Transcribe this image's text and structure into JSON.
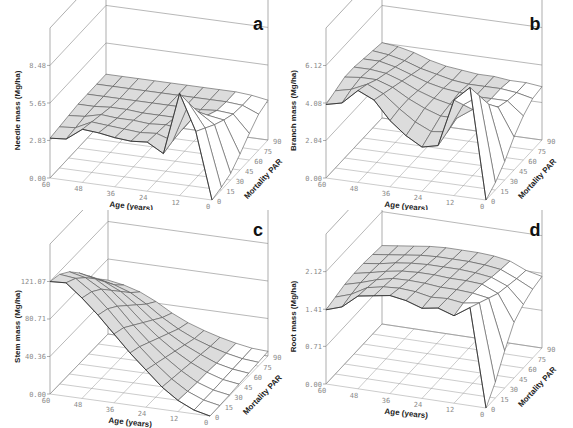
{
  "figure": {
    "panels_order": [
      "a",
      "b",
      "c",
      "d"
    ]
  },
  "chart_data": [
    {
      "id": "a",
      "type": "surface3d",
      "panel_label": "a",
      "zlabel": "Needle mass (Mg/ha)",
      "xlabel": "Age (years)",
      "ylabel": "Mortality PAR",
      "x_ticks": [
        "60",
        "48",
        "36",
        "24",
        "12",
        "0"
      ],
      "y_ticks": [
        "0",
        "15",
        "30",
        "45",
        "60",
        "75",
        "90"
      ],
      "z_ticks": [
        "0.00",
        "2.83",
        "5.65",
        "8.48"
      ],
      "zlim": [
        0,
        11.3
      ],
      "x": [
        60,
        54,
        48,
        42,
        36,
        30,
        24,
        18,
        12,
        6,
        0
      ],
      "y": [
        0,
        15,
        30,
        45,
        60,
        75,
        90
      ],
      "z": [
        [
          3.0,
          3.1,
          4.0,
          3.9,
          3.7,
          3.6,
          3.7,
          3.0,
          7.7,
          5.0,
          0.0
        ],
        [
          3.1,
          3.2,
          3.8,
          3.7,
          3.6,
          3.5,
          3.6,
          3.2,
          6.2,
          4.5,
          0.2
        ],
        [
          3.2,
          3.3,
          3.6,
          3.5,
          3.5,
          3.4,
          3.5,
          3.3,
          4.8,
          4.0,
          0.5
        ],
        [
          3.3,
          3.3,
          3.4,
          3.4,
          3.3,
          3.3,
          3.3,
          3.3,
          3.8,
          3.6,
          1.2
        ],
        [
          3.3,
          3.3,
          3.3,
          3.3,
          3.3,
          3.3,
          3.3,
          3.3,
          3.4,
          3.3,
          2.0
        ],
        [
          3.3,
          3.3,
          3.3,
          3.3,
          3.3,
          3.3,
          3.3,
          3.3,
          3.3,
          3.2,
          2.7
        ],
        [
          3.3,
          3.3,
          3.3,
          3.3,
          3.3,
          3.3,
          3.3,
          3.3,
          3.3,
          3.2,
          3.0
        ]
      ]
    },
    {
      "id": "b",
      "type": "surface3d",
      "panel_label": "b",
      "zlabel": "Branch mass (Mg/ha)",
      "xlabel": "Age (years)",
      "ylabel": "Mortality PAR",
      "x_ticks": [
        "60",
        "48",
        "36",
        "24",
        "12",
        "0"
      ],
      "y_ticks": [
        "0",
        "15",
        "30",
        "45",
        "60",
        "75",
        "90"
      ],
      "z_ticks": [
        "0.00",
        "2.04",
        "4.08",
        "6.12"
      ],
      "zlim": [
        0,
        8.16
      ],
      "x": [
        60,
        54,
        48,
        42,
        36,
        30,
        24,
        18,
        12,
        6,
        0
      ],
      "y": [
        0,
        15,
        30,
        45,
        60,
        75,
        90
      ],
      "z": [
        [
          4.0,
          4.2,
          5.0,
          4.6,
          3.6,
          2.9,
          2.4,
          2.6,
          5.2,
          6.0,
          0.0
        ],
        [
          4.2,
          4.4,
          4.8,
          4.4,
          3.7,
          3.1,
          2.7,
          2.8,
          4.4,
          5.0,
          0.4
        ],
        [
          4.4,
          4.5,
          4.5,
          4.2,
          3.7,
          3.3,
          3.0,
          3.0,
          3.6,
          4.0,
          1.0
        ],
        [
          4.4,
          4.4,
          4.3,
          4.0,
          3.6,
          3.3,
          3.1,
          3.1,
          3.2,
          3.3,
          1.8
        ],
        [
          4.3,
          4.3,
          4.1,
          3.8,
          3.5,
          3.3,
          3.2,
          3.1,
          3.1,
          3.1,
          2.4
        ],
        [
          4.2,
          4.1,
          3.9,
          3.6,
          3.4,
          3.2,
          3.1,
          3.1,
          3.1,
          3.0,
          2.8
        ],
        [
          4.1,
          4.0,
          3.8,
          3.5,
          3.3,
          3.2,
          3.1,
          3.1,
          3.0,
          3.0,
          2.9
        ]
      ]
    },
    {
      "id": "c",
      "type": "surface3d",
      "panel_label": "c",
      "zlabel": "Stem mass (Mg/ha)",
      "xlabel": "Age (years)",
      "ylabel": "Mortality PAR",
      "x_ticks": [
        "60",
        "48",
        "36",
        "24",
        "12",
        "0"
      ],
      "y_ticks": [
        "0",
        "15",
        "30",
        "45",
        "60",
        "75",
        "90"
      ],
      "z_ticks": [
        "0.00",
        "40.36",
        "80.71",
        "121.07"
      ],
      "zlim": [
        0,
        161.4
      ],
      "x": [
        60,
        54,
        48,
        42,
        36,
        30,
        24,
        18,
        12,
        6,
        0
      ],
      "y": [
        0,
        15,
        30,
        45,
        60,
        75,
        90
      ],
      "z": [
        [
          121.0,
          122.0,
          108.0,
          92.0,
          74.0,
          56.0,
          40.0,
          24.0,
          12.0,
          4.0,
          0.0
        ],
        [
          118.0,
          116.0,
          104.0,
          88.0,
          70.0,
          52.0,
          36.0,
          22.0,
          11.0,
          4.0,
          0.5
        ],
        [
          110.0,
          106.0,
          96.0,
          80.0,
          62.0,
          46.0,
          32.0,
          20.0,
          10.0,
          4.0,
          1.0
        ],
        [
          98.0,
          94.0,
          84.0,
          70.0,
          54.0,
          40.0,
          28.0,
          18.0,
          10.0,
          4.5,
          2.0
        ],
        [
          84.0,
          80.0,
          72.0,
          60.0,
          46.0,
          34.0,
          24.0,
          16.0,
          9.0,
          5.0,
          3.0
        ],
        [
          70.0,
          66.0,
          60.0,
          50.0,
          38.0,
          28.0,
          20.0,
          14.0,
          9.0,
          5.5,
          4.0
        ],
        [
          58.0,
          55.0,
          50.0,
          42.0,
          32.0,
          24.0,
          18.0,
          13.0,
          9.0,
          6.0,
          5.0
        ]
      ]
    },
    {
      "id": "d",
      "type": "surface3d",
      "panel_label": "d",
      "zlabel": "Root mass (Mg/ha)",
      "xlabel": "Age (years)",
      "ylabel": "Mortality PAR",
      "x_ticks": [
        "60",
        "48",
        "36",
        "24",
        "12",
        "0"
      ],
      "y_ticks": [
        "0",
        "15",
        "30",
        "45",
        "60",
        "75",
        "90"
      ],
      "z_ticks": [
        "0.00",
        "0.71",
        "1.41",
        "2.12"
      ],
      "zlim": [
        0,
        2.83
      ],
      "x": [
        60,
        54,
        48,
        42,
        36,
        30,
        24,
        18,
        12,
        6,
        0
      ],
      "y": [
        0,
        15,
        30,
        45,
        60,
        75,
        90
      ],
      "z": [
        [
          1.4,
          1.5,
          1.75,
          1.8,
          1.85,
          1.8,
          1.7,
          1.75,
          1.65,
          1.85,
          0.0
        ],
        [
          1.45,
          1.55,
          1.72,
          1.78,
          1.8,
          1.78,
          1.72,
          1.74,
          1.7,
          1.75,
          0.3
        ],
        [
          1.5,
          1.58,
          1.68,
          1.75,
          1.76,
          1.75,
          1.72,
          1.72,
          1.7,
          1.65,
          0.7
        ],
        [
          1.52,
          1.58,
          1.65,
          1.7,
          1.72,
          1.72,
          1.7,
          1.7,
          1.68,
          1.55,
          1.05
        ],
        [
          1.52,
          1.56,
          1.62,
          1.66,
          1.68,
          1.68,
          1.68,
          1.66,
          1.62,
          1.5,
          1.2
        ],
        [
          1.5,
          1.54,
          1.58,
          1.62,
          1.64,
          1.64,
          1.64,
          1.62,
          1.58,
          1.45,
          1.3
        ],
        [
          1.48,
          1.52,
          1.56,
          1.6,
          1.62,
          1.62,
          1.62,
          1.6,
          1.55,
          1.42,
          1.35
        ]
      ]
    }
  ]
}
